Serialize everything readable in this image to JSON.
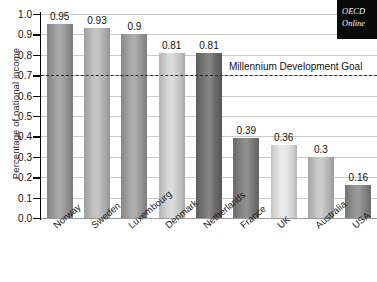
{
  "chart_data": {
    "type": "bar",
    "title": "",
    "xlabel": "",
    "ylabel": "Percentage of national income",
    "ylim": [
      0.0,
      1.0
    ],
    "ytick_step": 0.1,
    "grid": true,
    "legend": "none",
    "categories": [
      "Norway",
      "Sweden",
      "Luxembourg",
      "Denmark",
      "Netherlands",
      "France",
      "UK",
      "Australia",
      "USA"
    ],
    "values": [
      0.95,
      0.93,
      0.9,
      0.81,
      0.81,
      0.39,
      0.36,
      0.3,
      0.16
    ],
    "value_labels": [
      "0.95",
      "0.93",
      "0.9",
      "0.81",
      "0.81",
      "0.39",
      "0.36",
      "0.3",
      "0.16"
    ],
    "bar_colors": [
      "#9b9b9b",
      "#bcbcbc",
      "#a0a0a0",
      "#d6d6d6",
      "#6f6f6f",
      "#7d7d7d",
      "#e9e9e9",
      "#c4c4c4",
      "#8a8a8a"
    ],
    "ytick_labels": [
      "0.0",
      "0.1",
      "0.2",
      "0.3",
      "0.4",
      "0.5",
      "0.6",
      "0.7",
      "0.8",
      "0.9",
      "1.0"
    ],
    "annotations": [
      {
        "name": "millennium-development-goal",
        "label": "Millennium Development Goal",
        "value": 0.7,
        "style": "dashed-horizontal-line"
      }
    ]
  },
  "watermark": {
    "line1": "OECD",
    "line2": "Online"
  }
}
